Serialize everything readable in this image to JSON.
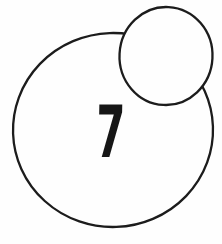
{
  "figure": {
    "label": "7",
    "background_color": "#fefefe",
    "line_color": "#1c1c1c",
    "number_color": "#161616",
    "shapes": {
      "large_circle": "large outlined circle",
      "small_circle": "small outlined circle overlapping top-right edge"
    }
  }
}
